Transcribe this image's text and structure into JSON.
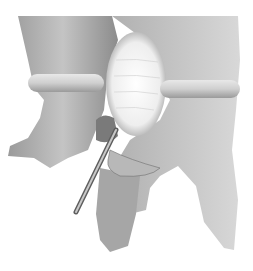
{
  "image": {
    "subject": "spinal vertebrae illustration with surgical instrument",
    "palette": {
      "background": "#ffffff",
      "bone_light": "#d8d8d8",
      "bone_mid": "#a8a8a8",
      "bone_dark": "#6e6e6e",
      "disc_highlight": "#f4f4f4",
      "instrument": "#8a8a8a"
    }
  }
}
